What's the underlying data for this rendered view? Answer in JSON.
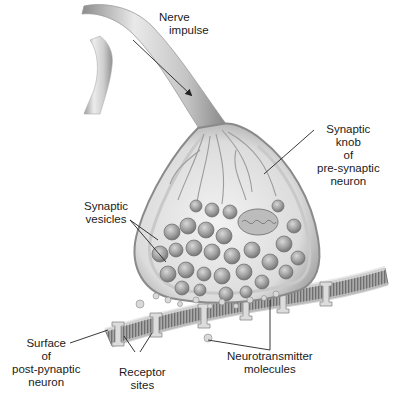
{
  "diagram": {
    "labels": {
      "nerve_impulse": {
        "line1": "Nerve",
        "line2": "impulse"
      },
      "synaptic_knob": {
        "line1": "Synaptic",
        "line2": "knob",
        "line3": "of",
        "line4": "pre-synaptic",
        "line5": "neuron"
      },
      "synaptic_vesicles": {
        "line1": "Synaptic",
        "line2": "vesicles"
      },
      "post_surface": {
        "line1": "Surface",
        "line2": "of",
        "line3": "post-pynaptic",
        "line4": "neuron"
      },
      "receptor_sites": {
        "line1": "Receptor",
        "line2": "sites"
      },
      "neurotransmitter": {
        "line1": "Neurotransmitter",
        "line2": "molecules"
      }
    },
    "colors": {
      "background": "#ffffff",
      "tissue_light": "#e6e6e6",
      "tissue_mid": "#b5b5b5",
      "tissue_dark": "#7a7a7a",
      "vesicle": "#9a9a9a",
      "leader_line": "#222222",
      "text": "#1a1a1a"
    }
  }
}
